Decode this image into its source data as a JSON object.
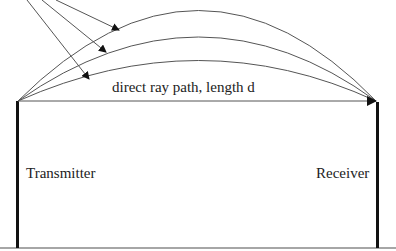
{
  "diagram": {
    "direct_ray_label": "direct ray path, length d",
    "transmitter_label": "Transmitter",
    "receiver_label": "Receiver",
    "icons": {
      "incoming_arrows": "arrow-icon",
      "arc_paths": "curved-ray-path",
      "direct_path": "straight-arrow"
    },
    "colors": {
      "line": "#555555",
      "pole": "#111111",
      "ground": "#888888",
      "text": "#222222"
    }
  }
}
